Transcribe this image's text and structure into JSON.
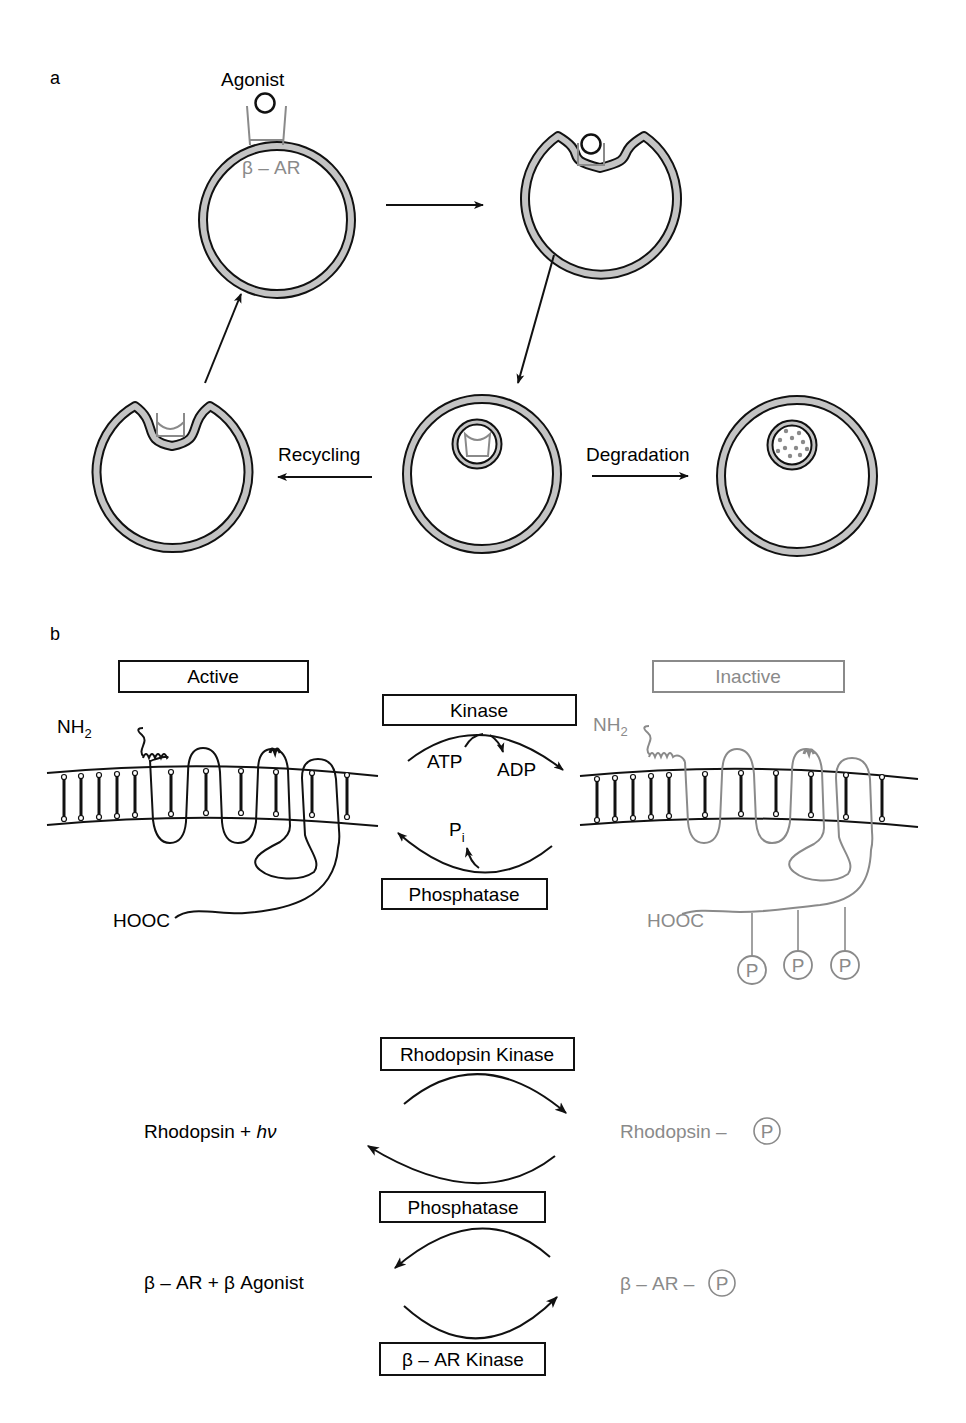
{
  "colors": {
    "ink": "#111111",
    "gray": "#8a8a8a",
    "membrane_fill": "#c4c4c4"
  },
  "panel_a": {
    "label": "a",
    "agonist_label": "Agonist",
    "receptor_label": "β – AR",
    "recycling_label": "Recycling",
    "degradation_label": "Degradation"
  },
  "panel_b": {
    "label": "b",
    "active_label": "Active",
    "inactive_label": "Inactive",
    "kinase_label": "Kinase",
    "phosphatase_label": "Phosphatase",
    "atp_label": "ATP",
    "adp_label": "ADP",
    "pi_label": "P",
    "pi_sub": "i",
    "nh2_label": "NH",
    "nh2_sub": "2",
    "hooc_label": "HOOC",
    "phospho_symbol": "P"
  },
  "reactions": {
    "rhodopsin": {
      "left": "Rhodopsin + hν",
      "left_main": "Rhodopsin + ",
      "left_italic": "hν",
      "right": "Rhodopsin –",
      "top_enzyme": "Rhodopsin Kinase",
      "bottom_enzyme": "Phosphatase"
    },
    "beta_ar": {
      "left": "β – AR + β Agonist",
      "right": "β – AR –",
      "bottom_enzyme": "β – AR Kinase"
    }
  }
}
